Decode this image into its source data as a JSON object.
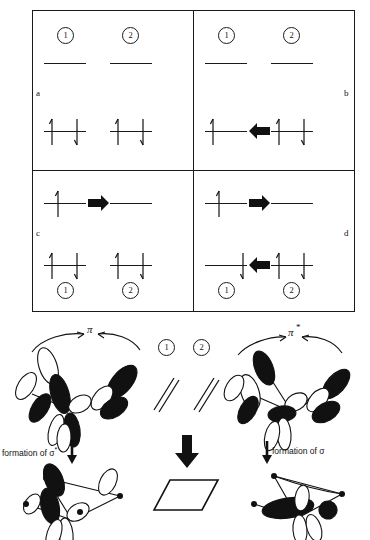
{
  "figure": {
    "mo_box": {
      "quadrants": [
        {
          "id": "a",
          "label": "a",
          "position": "top-left",
          "circle_labels": [
            "1",
            "2"
          ],
          "circles_position": "top",
          "upper_levels": [
            {
              "orbital": "pi-star-1",
              "electrons": []
            },
            {
              "orbital": "pi-star-2",
              "electrons": []
            }
          ],
          "lower_levels": [
            {
              "orbital": "pi-1",
              "electrons": [
                "up",
                "down"
              ]
            },
            {
              "orbital": "pi-2",
              "electrons": [
                "up",
                "down"
              ]
            }
          ],
          "transfer_arrow": null
        },
        {
          "id": "b",
          "label": "b",
          "position": "top-right",
          "circle_labels": [
            "1",
            "2"
          ],
          "circles_position": "top",
          "upper_levels": [
            {
              "orbital": "pi-star-1",
              "electrons": []
            },
            {
              "orbital": "pi-star-2",
              "electrons": []
            }
          ],
          "lower_levels": [
            {
              "orbital": "pi-1",
              "electrons": [
                "up"
              ]
            },
            {
              "orbital": "pi-2",
              "electrons": [
                "up",
                "down"
              ]
            }
          ],
          "transfer_arrow": {
            "direction": "left",
            "row": "lower"
          }
        },
        {
          "id": "c",
          "label": "c",
          "position": "bottom-left",
          "circle_labels": [
            "1",
            "2"
          ],
          "circles_position": "bottom",
          "upper_levels": [
            {
              "orbital": "pi-star-1",
              "electrons": [
                "up"
              ]
            },
            {
              "orbital": "pi-star-2",
              "electrons": []
            }
          ],
          "lower_levels": [
            {
              "orbital": "pi-1",
              "electrons": [
                "up",
                "down"
              ]
            },
            {
              "orbital": "pi-2",
              "electrons": [
                "up",
                "down"
              ]
            }
          ],
          "transfer_arrow": {
            "direction": "right",
            "row": "upper"
          }
        },
        {
          "id": "d",
          "label": "d",
          "position": "bottom-right",
          "circle_labels": [
            "1",
            "2"
          ],
          "circles_position": "bottom",
          "upper_levels": [
            {
              "orbital": "pi-star-1",
              "electrons": [
                "up"
              ]
            },
            {
              "orbital": "pi-star-2",
              "electrons": []
            }
          ],
          "lower_levels": [
            {
              "orbital": "pi-1",
              "electrons": [
                "down"
              ]
            },
            {
              "orbital": "pi-2",
              "electrons": [
                "up",
                "down"
              ]
            }
          ],
          "transfer_arrow_upper": {
            "direction": "right",
            "row": "upper"
          },
          "transfer_arrow_lower": {
            "direction": "left",
            "row": "lower"
          }
        }
      ]
    },
    "orbital_scheme": {
      "left_label": "π",
      "right_label": "π",
      "right_label_star": "*",
      "center_circles": [
        "1",
        "2"
      ],
      "center_alkene_symbol": "double-bond-parallel-lines",
      "left_formation_text": "formation of σ",
      "left_formation_star": "*",
      "right_formation_text": "formation of σ",
      "product_shape": "cyclobutane-parallelogram"
    }
  },
  "colors": {
    "ink": "#111111",
    "paper": "#ffffff",
    "lobe_filled": "#111111",
    "lobe_empty": "#ffffff"
  }
}
